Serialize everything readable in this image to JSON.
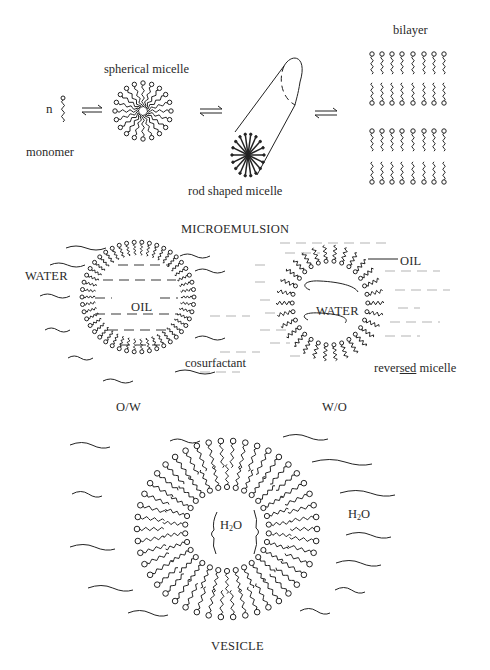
{
  "diagram": {
    "section_top": {
      "monomer_count": "n",
      "monomer_label": "monomer",
      "spherical_label": "spherical micelle",
      "rod_label": "rod shaped micelle",
      "bilayer_label": "bilayer",
      "equilibrium_symbol": "⇌"
    },
    "section_micro": {
      "title": "MICROEMULSION",
      "water_label": "WATER",
      "oil_inner_label": "OIL",
      "cosurfactant_label": "cosurfactant",
      "oil_outer_label": "OIL",
      "water_inner_label": "WATER",
      "reversed_label_pre": "rever",
      "reversed_label_ul": "sed",
      "reversed_label_post": " micelle",
      "ow_label": "O/W",
      "wo_label": "W/O"
    },
    "section_vesicle": {
      "h2o_inner_H": "H",
      "h2o_inner_sub": "2",
      "h2o_inner_O": "O",
      "h2o_outer_H": "H",
      "h2o_outer_sub": "2",
      "h2o_outer_O": "O",
      "title": "VESICLE"
    },
    "colors": {
      "ink": "#222222",
      "background": "#ffffff"
    }
  }
}
